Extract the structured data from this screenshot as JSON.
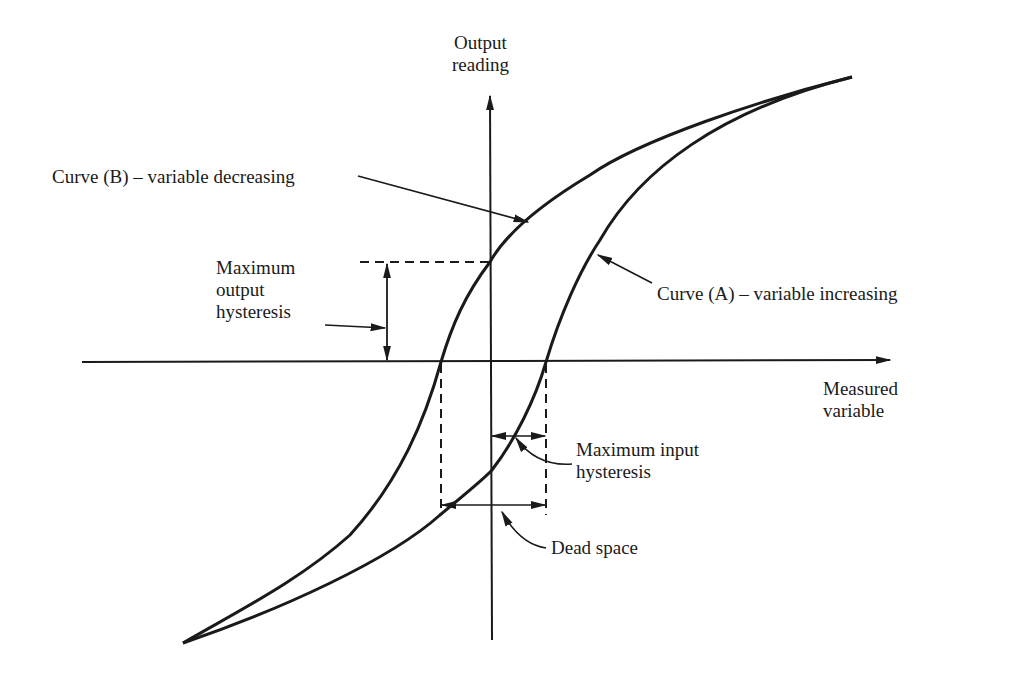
{
  "diagram": {
    "colors": {
      "ink": "#1a1a1a",
      "background": "#ffffff"
    },
    "axes": {
      "y_label": "Output\nreading",
      "x_label": "Measured\nvariable"
    },
    "curves": [
      {
        "id": "B",
        "label": "Curve (B) – variable decreasing"
      },
      {
        "id": "A",
        "label": "Curve (A) – variable increasing"
      }
    ],
    "annotations": {
      "max_output_hysteresis": "Maximum\noutput\nhysteresis",
      "max_input_hysteresis": "Maximum input\nhysteresis",
      "dead_space": "Dead space"
    }
  }
}
